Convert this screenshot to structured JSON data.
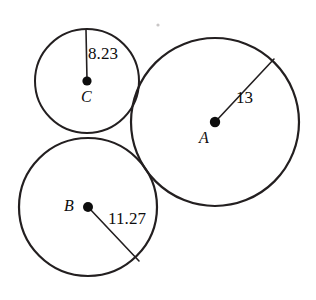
{
  "figure": {
    "background_color": "#ffffff",
    "stroke_color": "#231f20",
    "dot_color": "#0d0d0d",
    "width": 316,
    "height": 300
  },
  "circles": [
    {
      "id": "A",
      "center_label": "A",
      "radius_label": "13",
      "cx": 215,
      "cy": 122,
      "r": 84,
      "stroke_width": 2.2,
      "radius_line": {
        "x1": 216,
        "y1": 121,
        "x2": 274,
        "y2": 59
      },
      "dot_r": 5.2
    },
    {
      "id": "B",
      "center_label": "B",
      "radius_label": "11.27",
      "cx": 88,
      "cy": 207,
      "r": 69,
      "stroke_width": 2.2,
      "radius_line": {
        "x1": 89,
        "y1": 208,
        "x2": 139,
        "y2": 261
      },
      "dot_r": 5.0
    },
    {
      "id": "C",
      "center_label": "C",
      "radius_label": "8.23",
      "cx": 87,
      "cy": 81,
      "r": 52,
      "stroke_width": 2.0,
      "radius_line": {
        "x1": 86,
        "y1": 30,
        "x2": 87,
        "y2": 80
      },
      "dot_r": 4.6
    }
  ],
  "artifact": {
    "name": "scan-speck",
    "cx": 158,
    "cy": 25,
    "r": 1.6,
    "color": "#c9c6c6"
  }
}
